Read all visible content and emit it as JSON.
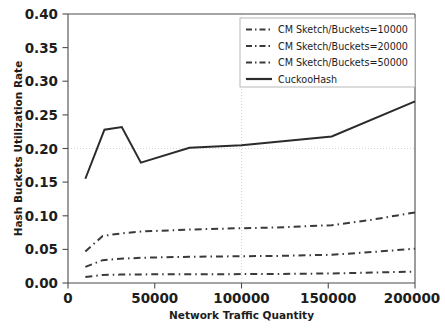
{
  "chart_data": {
    "type": "line",
    "title": "",
    "xlabel": "Network Traffic Quantity",
    "ylabel": "Hash Buckets Utilization Rate",
    "xlim": [
      0,
      200000
    ],
    "ylim": [
      0.0,
      0.4
    ],
    "xticks": [
      0,
      50000,
      100000,
      150000,
      200000
    ],
    "xtick_labels": [
      "0",
      "50000",
      "100000",
      "150000",
      "200000"
    ],
    "yticks": [
      0.0,
      0.05,
      0.1,
      0.15,
      0.2,
      0.25,
      0.3,
      0.35,
      0.4
    ],
    "ytick_labels": [
      "0.00",
      "0.05",
      "0.10",
      "0.15",
      "0.20",
      "0.25",
      "0.30",
      "0.35",
      "0.40"
    ],
    "grid": "dotted gridlines at y=0.20 and x=100000",
    "legend_position": "upper right",
    "series": [
      {
        "name": "CM Sketch/Buckets=10000",
        "style": "dash-dot",
        "color": "#3a3a3a",
        "x": [
          10000,
          20000,
          30000,
          42000,
          70000,
          100000,
          120000,
          152000,
          175000,
          200000
        ],
        "values": [
          0.047,
          0.07,
          0.0735,
          0.0765,
          0.0795,
          0.0815,
          0.0825,
          0.086,
          0.094,
          0.105
        ]
      },
      {
        "name": "CM Sketch/Buckets=20000",
        "style": "dash-dot",
        "color": "#3a3a3a",
        "x": [
          10000,
          20000,
          30000,
          42000,
          70000,
          100000,
          120000,
          152000,
          175000,
          200000
        ],
        "values": [
          0.024,
          0.034,
          0.036,
          0.0375,
          0.039,
          0.0398,
          0.0402,
          0.042,
          0.046,
          0.051
        ]
      },
      {
        "name": "CM Sketch/Buckets=50000",
        "style": "dash-dot",
        "color": "#3a3a3a",
        "x": [
          10000,
          20000,
          30000,
          42000,
          70000,
          100000,
          120000,
          152000,
          175000,
          200000
        ],
        "values": [
          0.009,
          0.012,
          0.0125,
          0.0128,
          0.013,
          0.0132,
          0.0134,
          0.0142,
          0.0155,
          0.017
        ]
      },
      {
        "name": "CuckooHash",
        "style": "solid",
        "color": "#2b2b2b",
        "x": [
          10000,
          21000,
          31000,
          42000,
          70000,
          100000,
          152000,
          200000
        ],
        "values": [
          0.155,
          0.228,
          0.232,
          0.179,
          0.201,
          0.205,
          0.218,
          0.27
        ]
      }
    ]
  },
  "legend": {
    "entries": [
      {
        "label": "CM Sketch/Buckets=10000",
        "style": "dash-dot"
      },
      {
        "label": "CM Sketch/Buckets=20000",
        "style": "dash-dot"
      },
      {
        "label": "CM Sketch/Buckets=50000",
        "style": "dash-dot"
      },
      {
        "label": "CuckooHash",
        "style": "solid"
      }
    ]
  },
  "colors": {
    "background": "#ffffff",
    "axis": "#4c4c4c",
    "grid": "#c8c8c8",
    "solid_series": "#2b2b2b",
    "dashed_series": "#3a3a3a",
    "text": "#1d1d1d"
  }
}
